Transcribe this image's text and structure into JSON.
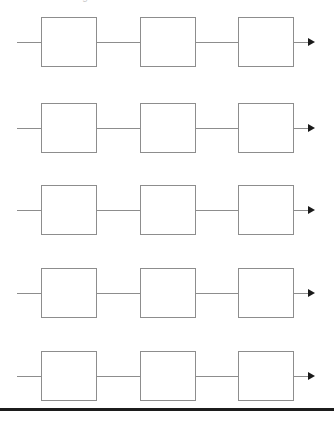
{
  "page": {
    "width": 334,
    "height": 422,
    "background_color": "#ffffff",
    "caption_clipped": "Block diagram",
    "bottom_rule": {
      "label": "horizontal-divider",
      "color": "#1c1c1c",
      "thickness_px": 3,
      "y_px": 408
    }
  },
  "diagram": {
    "type": "block-chain-diagram",
    "line_color": "#8d8d8d",
    "block_fill": "#ffffff",
    "arrow_color": "#1a1a1a",
    "row_count": 5,
    "blocks_per_row": 3,
    "block_width_px": 56,
    "block_height_px": 50,
    "rows": [
      {
        "id": "row-1",
        "y_px": 13,
        "blocks": [
          {
            "id": "r1-b1",
            "label": ""
          },
          {
            "id": "r1-b2",
            "label": ""
          },
          {
            "id": "r1-b3",
            "label": ""
          }
        ],
        "input_wire": "",
        "output_arrow": ""
      },
      {
        "id": "row-2",
        "y_px": 99,
        "blocks": [
          {
            "id": "r2-b1",
            "label": ""
          },
          {
            "id": "r2-b2",
            "label": ""
          },
          {
            "id": "r2-b3",
            "label": ""
          }
        ],
        "input_wire": "",
        "output_arrow": ""
      },
      {
        "id": "row-3",
        "y_px": 181,
        "blocks": [
          {
            "id": "r3-b1",
            "label": ""
          },
          {
            "id": "r3-b2",
            "label": ""
          },
          {
            "id": "r3-b3",
            "label": ""
          }
        ],
        "input_wire": "",
        "output_arrow": ""
      },
      {
        "id": "row-4",
        "y_px": 264,
        "blocks": [
          {
            "id": "r4-b1",
            "label": ""
          },
          {
            "id": "r4-b2",
            "label": ""
          },
          {
            "id": "r4-b3",
            "label": ""
          }
        ],
        "input_wire": "",
        "output_arrow": ""
      },
      {
        "id": "row-5",
        "y_px": 347,
        "blocks": [
          {
            "id": "r5-b1",
            "label": ""
          },
          {
            "id": "r5-b2",
            "label": ""
          },
          {
            "id": "r5-b3",
            "label": ""
          }
        ],
        "input_wire": "",
        "output_arrow": ""
      }
    ]
  }
}
